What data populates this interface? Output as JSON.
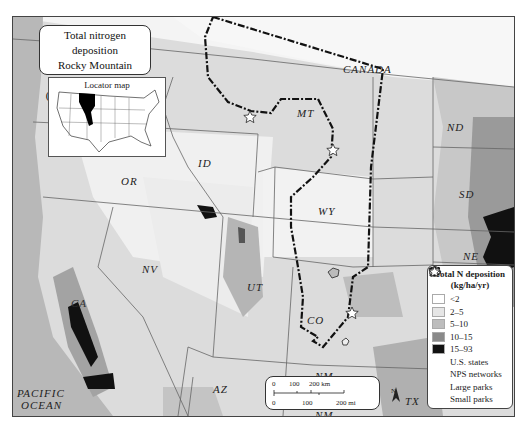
{
  "title": {
    "line1": "Total nitrogen deposition",
    "line2": "Rocky Mountain Network",
    "line3_italic": "Average",
    "line3_rest": ": 2010–2012)",
    "line3_open": "("
  },
  "locator": {
    "caption": "Locator map"
  },
  "labels": {
    "canada": "CANADA",
    "mt": "MT",
    "nd": "ND",
    "id": "ID",
    "or": "OR",
    "sd": "SD",
    "wy": "WY",
    "ne": "NE",
    "nv": "NV",
    "ut": "UT",
    "co": "CO",
    "ca": "CA",
    "az": "AZ",
    "nm_top": "NM",
    "nm_bottom": "NM",
    "tx": "TX",
    "pacific": "PACIFIC",
    "ocean": "OCEAN"
  },
  "legend": {
    "title_line1": "Total N deposition",
    "title_line2": "(kg/ha/yr)",
    "classes": [
      {
        "label": "<2",
        "color": "#ffffff"
      },
      {
        "label": "2–5",
        "color": "#e6e6e6"
      },
      {
        "label": "5–10",
        "color": "#bdbdbd"
      },
      {
        "label": "10–15",
        "color": "#8a8a8a"
      },
      {
        "label": "15–93",
        "color": "#111111"
      }
    ],
    "symbols": [
      {
        "label": "U.S. states",
        "icon": "state-outline-icon"
      },
      {
        "label": "NPS networks",
        "icon": "network-boundary-icon"
      },
      {
        "label": "Large parks",
        "icon": "park-outline-icon"
      },
      {
        "label": "Small parks",
        "icon": "star-icon"
      }
    ]
  },
  "scale_bar": {
    "km": [
      "0",
      "100",
      "200 km"
    ],
    "mi": [
      "0",
      "100",
      "200 mi"
    ]
  },
  "north_arrow": {
    "label": "N"
  }
}
